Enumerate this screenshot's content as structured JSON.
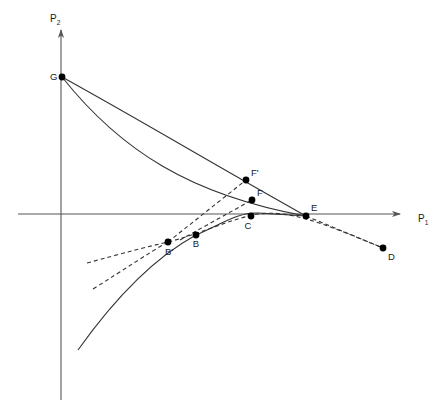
{
  "figure": {
    "background_color": "#ffffff",
    "line_color": "#333333",
    "axis_color": "#555555",
    "marker_color": "#000000",
    "width": 438,
    "height": 409
  },
  "axes": {
    "x_axis": {
      "name": "horizontal-axis",
      "label": "P",
      "subscript": "1",
      "label_x": 418,
      "label_y": 222,
      "start_x": 18,
      "end_x": 400,
      "y": 214
    },
    "y_axis": {
      "name": "vertical-axis",
      "label": "P",
      "subscript": "2",
      "label_x": 50,
      "label_y": 22,
      "x": 61,
      "start_y": 400,
      "end_y": 30
    },
    "origin": {
      "x": 61,
      "y": 214
    }
  },
  "points": [
    {
      "id": "G",
      "label": "G",
      "x": 62,
      "y": 77,
      "label_dx": -12,
      "label_dy": 3,
      "label_anchor": "start"
    },
    {
      "id": "Fp",
      "label": "F'",
      "x": 246,
      "y": 180,
      "label_dx": 5,
      "label_dy": -4,
      "label_anchor": "start"
    },
    {
      "id": "F",
      "label": "F",
      "x": 252,
      "y": 200,
      "label_dx": 5,
      "label_dy": -4,
      "label_anchor": "start"
    },
    {
      "id": "E",
      "label": "E",
      "x": 306,
      "y": 216,
      "label_dx": 5,
      "label_dy": -5,
      "label_anchor": "start"
    },
    {
      "id": "C",
      "label": "C",
      "x": 251,
      "y": 216,
      "label_dx": -3,
      "label_dy": 13,
      "label_anchor": "middle"
    },
    {
      "id": "B",
      "label": "B",
      "x": 196,
      "y": 235,
      "label_dx": 0,
      "label_dy": 12,
      "label_anchor": "middle"
    },
    {
      "id": "Bp",
      "label": "B'",
      "x": 168,
      "y": 242,
      "label_dx": 1,
      "label_dy": 13,
      "label_anchor": "middle"
    },
    {
      "id": "D",
      "label": "D",
      "x": 383,
      "y": 248,
      "label_dx": 5,
      "label_dy": 12,
      "label_anchor": "start"
    }
  ],
  "curves": [
    {
      "name": "outer-curve-G-to-E",
      "style": "solid",
      "description": "Upper nearly-straight curve from G through F' to E",
      "path": "M 62,77 C 140,120 215,165 306,216"
    },
    {
      "name": "inner-curve-G-to-E",
      "style": "solid",
      "description": "Lower bowed curve from G through F to E",
      "path": "M 62,77 C 120,150 190,195 306,216"
    },
    {
      "name": "solid-hump-curve",
      "style": "solid",
      "description": "Solid concave curve rising from lower-left through B', B, C peak and down to E",
      "path": "M 78,350 C 110,305 150,260 196,235 C 225,222 240,212 258,213 C 275,214 290,215 306,216"
    },
    {
      "name": "dashed-curve-Bprime-to-D",
      "style": "dashed",
      "description": "Dashed curve through B', C, E continuing down to D",
      "path": "M 87,263 C 120,254 150,246 168,242 C 200,234 230,219 258,214 C 290,210 320,222 383,248"
    },
    {
      "name": "dashed-tangent-lower-left",
      "style": "dashed",
      "description": "Second dashed line from lower-left up through B'",
      "path": "M 93,289 C 125,269 150,252 168,242"
    },
    {
      "name": "dashed-line-Bprime-to-Fprime",
      "style": "dashed",
      "description": "Dashed straight line from B' up to F'",
      "path": "M 168,242 L 246,180"
    },
    {
      "name": "dashed-line-B-to-F",
      "style": "dashed",
      "description": "Dashed straight line from B up to F",
      "path": "M 180,240 L 252,200"
    },
    {
      "name": "dashed-line-E-to-D",
      "style": "dashed",
      "description": "Dashed straight line from E continuing to D",
      "path": "M 306,216 L 383,248"
    }
  ]
}
